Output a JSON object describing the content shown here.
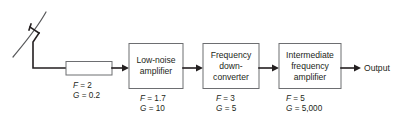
{
  "figure": {
    "background_color": "#ffffff",
    "line_color": "#231f20",
    "box_stroke_color": "#6d6e71",
    "dish_color": "#58595b"
  },
  "antenna": {
    "name": "parabolic-dish-antenna",
    "type": "reflector antenna with feed"
  },
  "stages": [
    {
      "id": "transmission-line",
      "shape": "plain-rectangle",
      "label_lines": [],
      "noise_figure_label": "F = 2",
      "gain_label": "G = 0.2",
      "noise_figure_symbol": "F",
      "noise_figure_value": "2",
      "gain_symbol": "G",
      "gain_value": "0.2"
    },
    {
      "id": "low-noise-amplifier",
      "shape": "block",
      "label_lines": [
        "Low-noise",
        "amplifier"
      ],
      "noise_figure_label": "F = 1.7",
      "gain_label": "G = 10",
      "noise_figure_symbol": "F",
      "noise_figure_value": "1.7",
      "gain_symbol": "G",
      "gain_value": "10"
    },
    {
      "id": "frequency-down-converter",
      "shape": "block",
      "label_lines": [
        "Frequency",
        "down-",
        "converter"
      ],
      "noise_figure_label": "F = 3",
      "gain_label": "G = 5",
      "noise_figure_symbol": "F",
      "noise_figure_value": "3",
      "gain_symbol": "G",
      "gain_value": "5"
    },
    {
      "id": "intermediate-frequency-amplifier",
      "shape": "block",
      "label_lines": [
        "Intermediate",
        "frequency",
        "amplifier"
      ],
      "noise_figure_label": "F = 5",
      "gain_label": "G = 5,000",
      "noise_figure_symbol": "F",
      "noise_figure_value": "5",
      "gain_symbol": "G",
      "gain_value": "5,000"
    }
  ],
  "labels": {
    "lna_line1": "Low-noise",
    "lna_line2": "amplifier",
    "fdc_line1": "Frequency",
    "fdc_line2": "down-",
    "fdc_line3": "converter",
    "ifa_line1": "Intermediate",
    "ifa_line2": "frequency",
    "ifa_line3": "amplifier",
    "output": "Output",
    "sym_F": "F",
    "sym_G": "G",
    "eq_F1": " = 2",
    "eq_G1": " = 0.2",
    "eq_F2": " = 1.7",
    "eq_G2": " = 10",
    "eq_F3": " = 3",
    "eq_G3": " = 5",
    "eq_F4": " = 5",
    "eq_G4": " = 5,000"
  }
}
